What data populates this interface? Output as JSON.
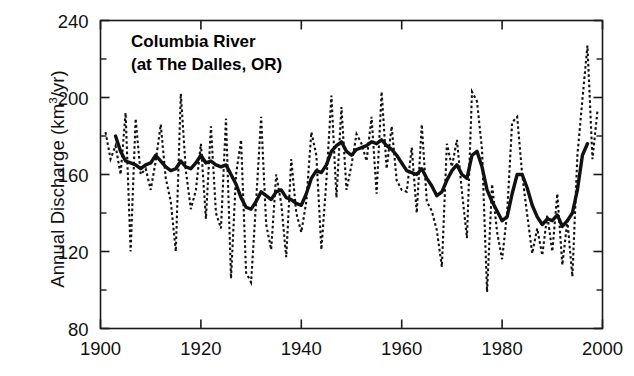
{
  "chart_data": {
    "type": "line",
    "title": "Columbia River",
    "subtitle": "(at The Dalles, OR)",
    "xlabel": "",
    "ylabel": "Annual Discharge (km3/yr)",
    "ylabel_prefix": "Annual Discharge (km",
    "ylabel_exponent": "3",
    "ylabel_suffix": "/yr)",
    "xlim": [
      1900,
      2000
    ],
    "ylim": [
      80,
      240
    ],
    "xticks": [
      1900,
      1920,
      1940,
      1960,
      1980,
      2000
    ],
    "xtick_labels": [
      "1900",
      "1920",
      "1940",
      "1960",
      "1980",
      "2000"
    ],
    "yticks": [
      80,
      120,
      160,
      200,
      240
    ],
    "ytick_labels": [
      "80",
      "120",
      "160",
      "200",
      "240"
    ],
    "y_minor_ticks": [
      100,
      140,
      180,
      220
    ],
    "grid": false,
    "legend": "none",
    "frame": "box",
    "series": [
      {
        "name": "Annual discharge",
        "style": "dotted",
        "color": "#111111",
        "x": [
          1901,
          1902,
          1903,
          1904,
          1905,
          1906,
          1907,
          1908,
          1909,
          1910,
          1911,
          1912,
          1913,
          1914,
          1915,
          1916,
          1917,
          1918,
          1919,
          1920,
          1921,
          1922,
          1923,
          1924,
          1925,
          1926,
          1927,
          1928,
          1929,
          1930,
          1931,
          1932,
          1933,
          1934,
          1935,
          1936,
          1937,
          1938,
          1939,
          1940,
          1941,
          1942,
          1943,
          1944,
          1945,
          1946,
          1947,
          1948,
          1949,
          1950,
          1951,
          1952,
          1953,
          1954,
          1955,
          1956,
          1957,
          1958,
          1959,
          1960,
          1961,
          1962,
          1963,
          1964,
          1965,
          1966,
          1967,
          1968,
          1969,
          1970,
          1971,
          1972,
          1973,
          1974,
          1975,
          1976,
          1977,
          1978,
          1979,
          1980,
          1981,
          1982,
          1983,
          1984,
          1985,
          1986,
          1987,
          1988,
          1989,
          1990,
          1991,
          1992,
          1993,
          1994,
          1995,
          1996,
          1997,
          1998,
          1999
        ],
        "values": [
          182,
          168,
          175,
          160,
          192,
          120,
          189,
          160,
          163,
          152,
          167,
          186,
          158,
          146,
          120,
          202,
          162,
          142,
          152,
          176,
          137,
          185,
          140,
          132,
          189,
          106,
          160,
          178,
          109,
          104,
          146,
          190,
          134,
          121,
          160,
          145,
          117,
          168,
          140,
          130,
          146,
          182,
          170,
          121,
          157,
          201,
          148,
          195,
          152,
          165,
          181,
          176,
          167,
          190,
          150,
          203,
          163,
          185,
          157,
          152,
          151,
          174,
          140,
          186,
          146,
          141,
          131,
          112,
          176,
          164,
          178,
          151,
          127,
          203,
          198,
          173,
          99,
          155,
          130,
          116,
          140,
          187,
          190,
          160,
          139,
          119,
          132,
          118,
          139,
          120,
          150,
          113,
          136,
          107,
          170,
          199,
          227,
          168,
          193
        ]
      },
      {
        "name": "Smoothed (running mean)",
        "style": "solid",
        "color": "#111111",
        "x": [
          1903,
          1904,
          1905,
          1906,
          1907,
          1908,
          1909,
          1910,
          1911,
          1912,
          1913,
          1914,
          1915,
          1916,
          1917,
          1918,
          1919,
          1920,
          1921,
          1922,
          1923,
          1924,
          1925,
          1926,
          1927,
          1928,
          1929,
          1930,
          1931,
          1932,
          1933,
          1934,
          1935,
          1936,
          1937,
          1938,
          1939,
          1940,
          1941,
          1942,
          1943,
          1944,
          1945,
          1946,
          1947,
          1948,
          1949,
          1950,
          1951,
          1952,
          1953,
          1954,
          1955,
          1956,
          1957,
          1958,
          1959,
          1960,
          1961,
          1962,
          1963,
          1964,
          1965,
          1966,
          1967,
          1968,
          1969,
          1970,
          1971,
          1972,
          1973,
          1974,
          1975,
          1976,
          1977,
          1978,
          1979,
          1980,
          1981,
          1982,
          1983,
          1984,
          1985,
          1986,
          1987,
          1988,
          1989,
          1990,
          1991,
          1992,
          1993,
          1994,
          1995,
          1996,
          1997
        ],
        "values": [
          180,
          172,
          167,
          166,
          165,
          163,
          165,
          166,
          170,
          167,
          164,
          162,
          163,
          167,
          164,
          163,
          166,
          170,
          166,
          167,
          165,
          164,
          165,
          160,
          155,
          148,
          143,
          142,
          146,
          151,
          149,
          147,
          151,
          152,
          148,
          147,
          145,
          144,
          150,
          158,
          162,
          161,
          165,
          172,
          175,
          177,
          172,
          170,
          173,
          174,
          175,
          177,
          176,
          178,
          175,
          173,
          170,
          166,
          162,
          161,
          160,
          163,
          158,
          154,
          149,
          151,
          157,
          162,
          165,
          160,
          158,
          170,
          172,
          164,
          152,
          146,
          141,
          136,
          138,
          150,
          160,
          160,
          153,
          144,
          138,
          134,
          137,
          136,
          139,
          133,
          136,
          140,
          152,
          170,
          176
        ]
      }
    ]
  }
}
